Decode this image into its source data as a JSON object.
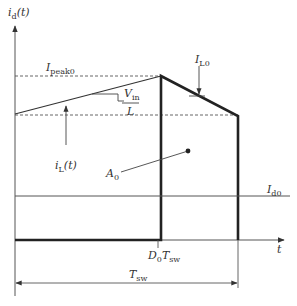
{
  "diagram": {
    "type": "waveform",
    "colors": {
      "line": "#222222",
      "thin": "#555555",
      "dashed": "#555555",
      "text": "#333333"
    },
    "labels": {
      "y_axis": {
        "main": "i",
        "sub": "d",
        "suffix": "(t)"
      },
      "x_axis": "t",
      "i_peak": {
        "main": "I",
        "sub": "peak0"
      },
      "slope_num": {
        "main": "V",
        "sub": "in"
      },
      "slope_den": "L",
      "i_l0": {
        "main": "I",
        "sub": "L0"
      },
      "i_l_t": {
        "main": "i",
        "sub": "L",
        "suffix": "(t)"
      },
      "area": {
        "main": "A",
        "sub": "0"
      },
      "i_d0": {
        "main": "I",
        "sub": "d0"
      },
      "d0_tsw": {
        "main": "D",
        "sub": "0",
        "main2": "T",
        "sub2": "sw"
      },
      "t_sw": {
        "main": "T",
        "sub": "sw"
      }
    }
  }
}
